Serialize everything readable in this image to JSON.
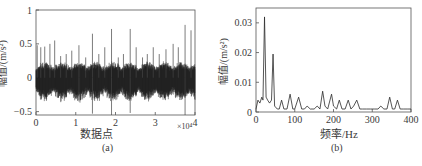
{
  "chart_data": [
    {
      "id": "a",
      "type": "line",
      "title": "",
      "caption": "(a)",
      "xlabel": "数据点",
      "ylabel": "幅值/(m/s²)",
      "x_multiplier": "×10⁴",
      "xlim": [
        0,
        4
      ],
      "ylim": [
        -0.55,
        1
      ],
      "xticks": [
        "0",
        "1",
        "2",
        "3",
        "4"
      ],
      "yticks": [
        "-0.5",
        "0",
        "0.5",
        "1"
      ],
      "grid": false,
      "description": "Vibration time-domain signal, 40000 samples; baseline noise band roughly ±0.2 with periodic impulsive spikes",
      "spikes": [
        {
          "x": 0.03,
          "y": 0.48
        },
        {
          "x": 0.12,
          "y": 0.45
        },
        {
          "x": 0.22,
          "y": 0.46
        },
        {
          "x": 0.35,
          "y": 0.5
        },
        {
          "x": 0.47,
          "y": 0.55
        },
        {
          "x": 0.62,
          "y": 0.32
        },
        {
          "x": 0.76,
          "y": 0.35
        },
        {
          "x": 0.9,
          "y": 0.4
        },
        {
          "x": 1.08,
          "y": 0.48
        },
        {
          "x": 1.25,
          "y": 0.3
        },
        {
          "x": 1.42,
          "y": 0.65
        },
        {
          "x": 1.58,
          "y": 0.35
        },
        {
          "x": 1.73,
          "y": 0.45
        },
        {
          "x": 1.9,
          "y": 0.72
        },
        {
          "x": 2.07,
          "y": 0.3
        },
        {
          "x": 2.2,
          "y": 0.35
        },
        {
          "x": 2.37,
          "y": 0.72
        },
        {
          "x": 2.52,
          "y": 0.45
        },
        {
          "x": 2.68,
          "y": 0.3
        },
        {
          "x": 2.8,
          "y": 0.35
        },
        {
          "x": 2.95,
          "y": 0.45
        },
        {
          "x": 3.1,
          "y": 0.35
        },
        {
          "x": 3.27,
          "y": 0.42
        },
        {
          "x": 3.45,
          "y": 0.5
        },
        {
          "x": 3.58,
          "y": 0.45
        },
        {
          "x": 3.75,
          "y": 0.78
        },
        {
          "x": 3.9,
          "y": 0.7
        }
      ],
      "neg_spikes": [
        {
          "x": 1.08,
          "y": -0.35
        },
        {
          "x": 1.42,
          "y": -0.53
        },
        {
          "x": 1.9,
          "y": -0.55
        },
        {
          "x": 2.37,
          "y": -0.52
        },
        {
          "x": 3.75,
          "y": -0.55
        }
      ]
    },
    {
      "id": "b",
      "type": "line",
      "title": "",
      "caption": "(b)",
      "xlabel": "频率/Hz",
      "ylabel": "幅值/(m/s²)",
      "xlim": [
        0,
        400
      ],
      "ylim": [
        0,
        0.035
      ],
      "xticks": [
        "0",
        "100",
        "200",
        "300",
        "400"
      ],
      "yticks": [
        "0",
        "0.01",
        "0.02",
        "0.03"
      ],
      "grid": false,
      "description": "Amplitude spectrum with dominant peaks near 22 Hz and 44 Hz",
      "x": [
        0,
        5,
        10,
        15,
        18,
        22,
        26,
        30,
        35,
        40,
        44,
        48,
        55,
        60,
        66,
        72,
        80,
        88,
        95,
        100,
        110,
        118,
        125,
        132,
        140,
        150,
        158,
        165,
        172,
        178,
        185,
        195,
        200,
        208,
        215,
        222,
        230,
        238,
        245,
        252,
        260,
        268,
        275,
        285,
        295,
        305,
        315,
        322,
        330,
        338,
        345,
        352,
        358,
        365,
        372,
        380,
        390,
        400
      ],
      "y": [
        0.001,
        0.004,
        0.003,
        0.005,
        0.004,
        0.032,
        0.005,
        0.004,
        0.003,
        0.004,
        0.0195,
        0.002,
        0.001,
        0.001,
        0.004,
        0.001,
        0.001,
        0.006,
        0.001,
        0.001,
        0.005,
        0.001,
        0.001,
        0.002,
        0.001,
        0.001,
        0.002,
        0.001,
        0.007,
        0.002,
        0.001,
        0.006,
        0.002,
        0.001,
        0.004,
        0.001,
        0.001,
        0.004,
        0.001,
        0.002,
        0.004,
        0.001,
        0.001,
        0.001,
        0.001,
        0.001,
        0.001,
        0.002,
        0.001,
        0.001,
        0.005,
        0.001,
        0.001,
        0.004,
        0.001,
        0.001,
        0.001,
        0.001
      ]
    }
  ],
  "figure": {
    "axis_color": "#555555",
    "line_color": "#2a2a2a",
    "noise_color": "#1e1e1e"
  }
}
